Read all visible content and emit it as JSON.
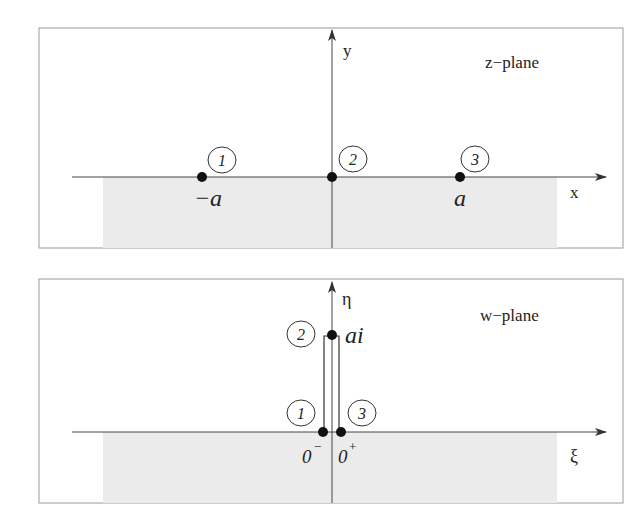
{
  "figure": {
    "panels": [
      {
        "id": "z-plane",
        "title": "z−plane",
        "x_axis_label": "x",
        "y_axis_label": "y",
        "points": [
          {
            "marker": "1",
            "label": "−a"
          },
          {
            "marker": "2",
            "label": ""
          },
          {
            "marker": "3",
            "label": "a"
          }
        ]
      },
      {
        "id": "w-plane",
        "title": "w−plane",
        "x_axis_label": "ξ",
        "y_axis_label": "η",
        "points": [
          {
            "marker": "1",
            "label": "0",
            "sup": "−"
          },
          {
            "marker": "2",
            "label": "ai"
          },
          {
            "marker": "3",
            "label": "0",
            "sup": "+"
          }
        ]
      }
    ],
    "colors": {
      "shade": "#ebebeb",
      "axis": "#444444",
      "frame": "#9a9a9a",
      "point": "#111111"
    }
  }
}
